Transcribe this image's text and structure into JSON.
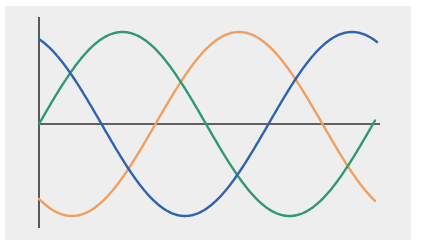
{
  "chart_data": {
    "type": "line",
    "title": "",
    "xlabel": "",
    "ylabel": "",
    "grid": false,
    "legend": null,
    "x_range": [
      0,
      2.05
    ],
    "y_range": [
      -1.1,
      1.1
    ],
    "x_unit": "cycles",
    "series": [
      {
        "name": "blue",
        "color": "#2f63ad",
        "function": "cos(2*pi*(x + 0.063))",
        "x": [
          0,
          0.25,
          0.5,
          0.75,
          1.0,
          1.25,
          1.5,
          1.75,
          2.0,
          2.02
        ],
        "values": [
          0.92,
          -0.39,
          -0.92,
          0.39,
          0.92,
          -0.39,
          -0.92,
          0.39,
          0.92,
          0.83
        ]
      },
      {
        "name": "green",
        "color": "#2e9a6e",
        "function": "sin(2*pi*x)",
        "x": [
          0,
          0.25,
          0.5,
          0.75,
          1.0
        ],
        "values": [
          0,
          1,
          0,
          -1,
          0
        ]
      },
      {
        "name": "orange",
        "color": "#ef9f60",
        "function": "-cos(2*pi*(x - 0.099))",
        "x": [
          0,
          0.099,
          0.35,
          0.6,
          0.85,
          1.0
        ],
        "values": [
          -0.81,
          -1,
          0,
          1,
          0,
          -0.88
        ]
      }
    ],
    "axes": {
      "y_axis": {
        "x": 39,
        "top": 17,
        "bottom": 228,
        "color": "#333333"
      },
      "x_axis": {
        "y": 124,
        "left": 39,
        "right": 380,
        "color": "#333333"
      }
    },
    "geometry": {
      "origin_x": 39,
      "center_y": 124,
      "amplitude_px": 92,
      "period_px": 334,
      "curves": [
        {
          "name": "blue",
          "kind": "cos",
          "peak_x": 18,
          "sign": -1,
          "x_start": 39,
          "x_end": 377
        },
        {
          "name": "green",
          "kind": "sin",
          "zero_x": 39,
          "sign": -1,
          "x_start": 39,
          "x_end": 375
        },
        {
          "name": "orange",
          "kind": "cos",
          "peak_x": 72,
          "sign": 1,
          "x_start": 39,
          "x_end": 375
        }
      ]
    }
  }
}
